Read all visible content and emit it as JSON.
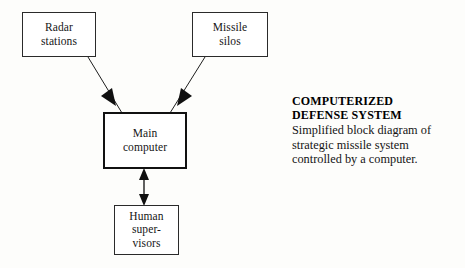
{
  "figure": {
    "background_color": "#fdfdfb",
    "ink_color": "#1a1a1a"
  },
  "diagram": {
    "nodes": [
      {
        "id": "radar-stations",
        "label": "Radar stations",
        "lines": [
          "Radar",
          "stations"
        ],
        "border": "thin"
      },
      {
        "id": "missile-silos",
        "label": "Missile silos",
        "lines": [
          "Missile",
          "silos"
        ],
        "border": "thin"
      },
      {
        "id": "main-computer",
        "label": "Main computer",
        "lines": [
          "Main",
          "computer"
        ],
        "border": "thick"
      },
      {
        "id": "human-supervisors",
        "label": "Human supervisors",
        "lines": [
          "Human",
          "super-",
          "visors"
        ],
        "border": "thin"
      }
    ],
    "connectors": [
      {
        "id": "radar-to-main",
        "from": "radar-stations",
        "to": "main-computer",
        "direction": "one-way",
        "arrowheads": "end"
      },
      {
        "id": "main-to-missile",
        "from": "main-computer",
        "to": "missile-silos",
        "direction": "one-way",
        "arrowheads": "end"
      },
      {
        "id": "main-to-human",
        "from": "main-computer",
        "to": "human-supervisors",
        "direction": "two-way",
        "arrowheads": "both"
      }
    ]
  },
  "caption": {
    "headline_lines": [
      "COMPUTERIZED",
      "DEFENSE SYSTEM"
    ],
    "headline": "COMPUTERIZED DEFENSE SYSTEM",
    "body_lines": [
      "Simplified block diagram of",
      "strategic missile system",
      "controlled by a computer."
    ],
    "body": "Simplified block diagram of strategic missile system controlled by a computer."
  }
}
